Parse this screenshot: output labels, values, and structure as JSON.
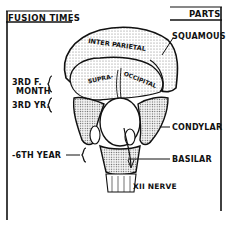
{
  "header": {
    "left_title": "FUSION TIMES",
    "right_title": "PARTS"
  },
  "fusion_times": [
    {
      "line1": "3RD F.",
      "line2": "MONTH"
    },
    {
      "line1": "3RD YR.",
      "line2": ""
    },
    {
      "line1": "-6TH YEAR",
      "line2": ""
    }
  ],
  "parts": {
    "squamous": "SQUAMOUS",
    "condylar": "CONDYLAR",
    "basilar": "BASILAR",
    "nerve": "XII NERVE"
  },
  "bone_labels": {
    "interparietal": "INTER PARIETAL",
    "supraoccipital_a": "SUPRA-",
    "supraoccipital_b": "OCCIPITAL"
  },
  "colors": {
    "ink": "#111111",
    "paper": "#ffffff",
    "stipple": "#9a9a9a"
  }
}
